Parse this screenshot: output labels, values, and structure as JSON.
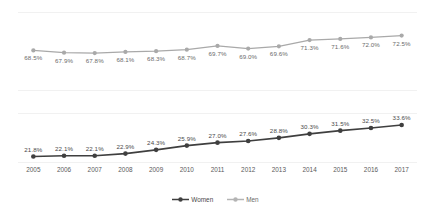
{
  "chart_data": {
    "type": "line",
    "title": "",
    "xlabel": "",
    "ylabel": "",
    "grid": true,
    "legend_position": "bottom",
    "panels": "two stacked panels sharing one x axis",
    "categories": [
      "2005",
      "2006",
      "2007",
      "2008",
      "2009",
      "2010",
      "2011",
      "2012",
      "2013",
      "2014",
      "2015",
      "2016",
      "2017"
    ],
    "series": [
      {
        "name": "Men",
        "color": "#a9a9a9",
        "panel": "top",
        "label_position": "below",
        "values": [
          68.5,
          67.9,
          67.8,
          68.1,
          68.3,
          68.7,
          69.7,
          69.0,
          69.6,
          71.3,
          71.6,
          72.0,
          72.5
        ],
        "labels": [
          "68.5%",
          "67.9%",
          "67.8%",
          "68.1%",
          "68.3%",
          "68.7%",
          "69.7%",
          "69.0%",
          "69.6%",
          "71.3%",
          "71.6%",
          "72.0%",
          "72.5%"
        ],
        "ylim": [
          67.0,
          74.0
        ]
      },
      {
        "name": "Women",
        "color": "#3f3f3f",
        "panel": "bottom",
        "label_position": "above",
        "values": [
          21.8,
          22.1,
          22.1,
          22.9,
          24.3,
          25.9,
          27.0,
          27.6,
          28.8,
          30.3,
          31.5,
          32.5,
          33.6
        ],
        "labels": [
          "21.8%",
          "22.1%",
          "22.1%",
          "22.9%",
          "24.3%",
          "25.9%",
          "27.0%",
          "27.6%",
          "28.8%",
          "30.3%",
          "31.5%",
          "32.5%",
          "33.6%"
        ],
        "ylim": [
          20.5,
          35.5
        ]
      }
    ]
  },
  "legend": {
    "items": [
      {
        "label": "Women",
        "color": "#3f3f3f"
      },
      {
        "label": "Men",
        "color": "#b4b4b4"
      }
    ]
  }
}
